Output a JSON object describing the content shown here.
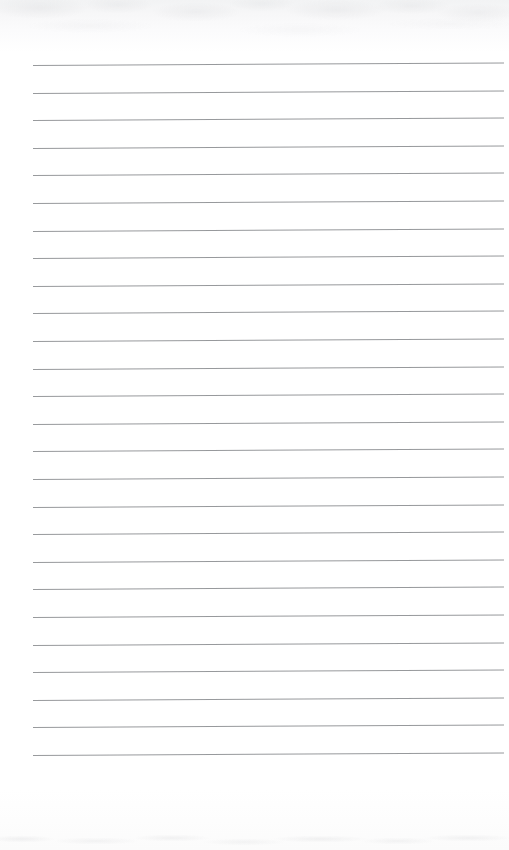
{
  "document": {
    "type": "lined-paper-scan",
    "title": "Blank Ruled Notebook Page",
    "content_text": "",
    "is_blank": true,
    "width_px": 509,
    "height_px": 850
  },
  "paper": {
    "background_color": "#ffffff",
    "top_tint_color": "#f2f3f4",
    "bottom_tint_color": "#fbfbfb",
    "noise_color": "#96989e"
  },
  "ruling": {
    "line_color": "#8e9094",
    "line_thickness_px": 1,
    "line_count": 26,
    "left_margin_px": 33,
    "right_edge_px": 504,
    "first_line_y_px": 65,
    "last_line_y_px": 755,
    "line_spacing_px": 27.6,
    "slope_px": -2.5,
    "lines": [
      {
        "index": 1,
        "y": 65,
        "text": ""
      },
      {
        "index": 2,
        "y": 93,
        "text": ""
      },
      {
        "index": 3,
        "y": 120,
        "text": ""
      },
      {
        "index": 4,
        "y": 148,
        "text": ""
      },
      {
        "index": 5,
        "y": 175,
        "text": ""
      },
      {
        "index": 6,
        "y": 203,
        "text": ""
      },
      {
        "index": 7,
        "y": 231,
        "text": ""
      },
      {
        "index": 8,
        "y": 258,
        "text": ""
      },
      {
        "index": 9,
        "y": 286,
        "text": ""
      },
      {
        "index": 10,
        "y": 313,
        "text": ""
      },
      {
        "index": 11,
        "y": 341,
        "text": ""
      },
      {
        "index": 12,
        "y": 369,
        "text": ""
      },
      {
        "index": 13,
        "y": 396,
        "text": ""
      },
      {
        "index": 14,
        "y": 424,
        "text": ""
      },
      {
        "index": 15,
        "y": 451,
        "text": ""
      },
      {
        "index": 16,
        "y": 479,
        "text": ""
      },
      {
        "index": 17,
        "y": 507,
        "text": ""
      },
      {
        "index": 18,
        "y": 534,
        "text": ""
      },
      {
        "index": 19,
        "y": 562,
        "text": ""
      },
      {
        "index": 20,
        "y": 589,
        "text": ""
      },
      {
        "index": 21,
        "y": 617,
        "text": ""
      },
      {
        "index": 22,
        "y": 645,
        "text": ""
      },
      {
        "index": 23,
        "y": 672,
        "text": ""
      },
      {
        "index": 24,
        "y": 700,
        "text": ""
      },
      {
        "index": 25,
        "y": 727,
        "text": ""
      },
      {
        "index": 26,
        "y": 755,
        "text": ""
      }
    ]
  }
}
